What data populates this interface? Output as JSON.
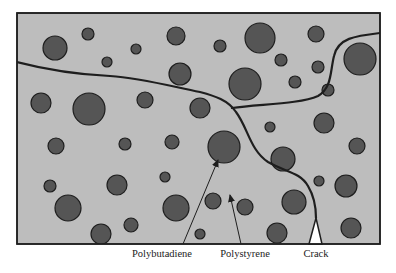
{
  "diagram": {
    "type": "material-microstructure",
    "colors": {
      "background": "#ffffff",
      "matrix_fill": "#bdbdbd",
      "particle_fill": "#555555",
      "stroke": "#1e1e1e"
    },
    "frame": {
      "x": 17,
      "y": 13,
      "width": 363,
      "height": 231
    },
    "particles": [
      {
        "cx": 55,
        "cy": 48,
        "r": 12
      },
      {
        "cx": 88,
        "cy": 34,
        "r": 6
      },
      {
        "cx": 136,
        "cy": 49,
        "r": 5
      },
      {
        "cx": 107,
        "cy": 62,
        "r": 5
      },
      {
        "cx": 176,
        "cy": 36,
        "r": 9
      },
      {
        "cx": 220,
        "cy": 46,
        "r": 6
      },
      {
        "cx": 260,
        "cy": 38,
        "r": 15
      },
      {
        "cx": 316,
        "cy": 34,
        "r": 8
      },
      {
        "cx": 281,
        "cy": 60,
        "r": 6
      },
      {
        "cx": 180,
        "cy": 74,
        "r": 11
      },
      {
        "cx": 245,
        "cy": 84,
        "r": 16
      },
      {
        "cx": 318,
        "cy": 67,
        "r": 6
      },
      {
        "cx": 295,
        "cy": 82,
        "r": 6
      },
      {
        "cx": 360,
        "cy": 59,
        "r": 16
      },
      {
        "cx": 328,
        "cy": 90,
        "r": 6
      },
      {
        "cx": 41,
        "cy": 103,
        "r": 10
      },
      {
        "cx": 89,
        "cy": 109,
        "r": 16
      },
      {
        "cx": 145,
        "cy": 100,
        "r": 8
      },
      {
        "cx": 200,
        "cy": 108,
        "r": 10
      },
      {
        "cx": 270,
        "cy": 127,
        "r": 5
      },
      {
        "cx": 324,
        "cy": 123,
        "r": 10
      },
      {
        "cx": 56,
        "cy": 146,
        "r": 8
      },
      {
        "cx": 125,
        "cy": 144,
        "r": 6
      },
      {
        "cx": 172,
        "cy": 142,
        "r": 7
      },
      {
        "cx": 224,
        "cy": 147,
        "r": 16
      },
      {
        "cx": 283,
        "cy": 159,
        "r": 12
      },
      {
        "cx": 357,
        "cy": 146,
        "r": 8
      },
      {
        "cx": 50,
        "cy": 186,
        "r": 6
      },
      {
        "cx": 117,
        "cy": 185,
        "r": 10
      },
      {
        "cx": 165,
        "cy": 177,
        "r": 5
      },
      {
        "cx": 213,
        "cy": 201,
        "r": 8
      },
      {
        "cx": 245,
        "cy": 207,
        "r": 8
      },
      {
        "cx": 319,
        "cy": 181,
        "r": 5
      },
      {
        "cx": 346,
        "cy": 186,
        "r": 11
      },
      {
        "cx": 68,
        "cy": 208,
        "r": 13
      },
      {
        "cx": 131,
        "cy": 225,
        "r": 7
      },
      {
        "cx": 176,
        "cy": 208,
        "r": 13
      },
      {
        "cx": 294,
        "cy": 202,
        "r": 12
      },
      {
        "cx": 101,
        "cy": 234,
        "r": 10
      },
      {
        "cx": 200,
        "cy": 234,
        "r": 5
      },
      {
        "cx": 277,
        "cy": 233,
        "r": 10
      },
      {
        "cx": 351,
        "cy": 228,
        "r": 10
      },
      {
        "cx": 384,
        "cy": 166,
        "r": 0
      }
    ],
    "cracks": [
      "M17,62 C40,68 70,74 110,76 C140,78 170,86 200,92 C215,96 228,100 236,112 C248,128 250,150 268,162 C285,172 300,172 308,186 C314,196 316,206 316,218",
      "M232,108 C260,104 300,104 318,96 C332,88 330,72 334,56 C338,38 355,36 380,33"
    ],
    "crack_notch": {
      "points": "309,244 316,218 322,244"
    },
    "arrows": [
      {
        "name": "polybutadiene-arrow",
        "x1": 183,
        "y1": 244,
        "x2": 218,
        "y2": 160
      },
      {
        "name": "polystyrene-arrow",
        "x1": 241,
        "y1": 244,
        "x2": 230,
        "y2": 195
      }
    ],
    "labels": [
      {
        "id": "polybutadiene",
        "text": "Polybutadiene",
        "x": 162,
        "y": 248
      },
      {
        "id": "polystyrene",
        "text": "Polystyrene",
        "x": 245,
        "y": 248
      },
      {
        "id": "crack",
        "text": "Crack",
        "x": 316,
        "y": 248
      }
    ]
  }
}
